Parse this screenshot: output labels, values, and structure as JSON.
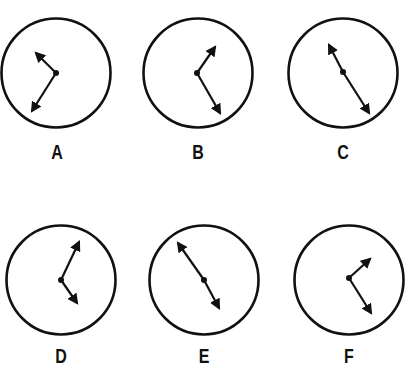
{
  "colors": {
    "ink": "#111111",
    "background": "#ffffff"
  },
  "clocks": [
    {
      "label": "A",
      "cx": 56,
      "cy": 73,
      "r": 56,
      "px": 56,
      "py": 73,
      "hands": [
        {
          "x": 36,
          "y": 53
        },
        {
          "x": 32,
          "y": 111
        }
      ],
      "label_x": 57,
      "label_y": 142
    },
    {
      "label": "B",
      "cx": 198,
      "cy": 73,
      "r": 56,
      "px": 197,
      "py": 73,
      "hands": [
        {
          "x": 215,
          "y": 47
        },
        {
          "x": 220,
          "y": 113
        }
      ],
      "label_x": 198,
      "label_y": 142
    },
    {
      "label": "C",
      "cx": 343,
      "cy": 73,
      "r": 56,
      "px": 343,
      "py": 72,
      "hands": [
        {
          "x": 329,
          "y": 45
        },
        {
          "x": 369,
          "y": 113
        }
      ],
      "label_x": 343,
      "label_y": 142
    },
    {
      "label": "D",
      "cx": 61,
      "cy": 280,
      "r": 56,
      "px": 61,
      "py": 280,
      "hands": [
        {
          "x": 79,
          "y": 242
        },
        {
          "x": 77,
          "y": 303
        }
      ],
      "label_x": 61,
      "label_y": 346
    },
    {
      "label": "E",
      "cx": 204,
      "cy": 280,
      "r": 56,
      "px": 204,
      "py": 280,
      "hands": [
        {
          "x": 178,
          "y": 243
        },
        {
          "x": 219,
          "y": 308
        }
      ],
      "label_x": 204,
      "label_y": 346
    },
    {
      "label": "F",
      "cx": 349,
      "cy": 280,
      "r": 56,
      "px": 349,
      "py": 278,
      "hands": [
        {
          "x": 370,
          "y": 259
        },
        {
          "x": 371,
          "y": 313
        }
      ],
      "label_x": 349,
      "label_y": 346
    }
  ]
}
